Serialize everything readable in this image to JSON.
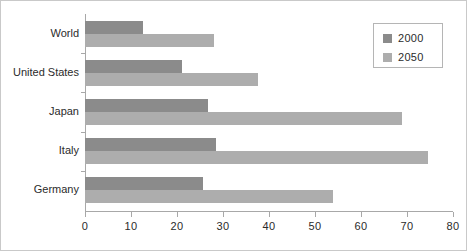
{
  "chart_data": {
    "type": "bar",
    "orientation": "horizontal",
    "title": "",
    "xlabel": "",
    "ylabel": "",
    "categories": [
      "World",
      "United States",
      "Japan",
      "Italy",
      "Germany"
    ],
    "series": [
      {
        "name": "2000",
        "color": "#8b8b8b",
        "values": [
          12.6,
          21.0,
          26.7,
          28.5,
          25.7
        ]
      },
      {
        "name": "2050",
        "color": "#adadad",
        "values": [
          28.0,
          37.5,
          69.0,
          74.5,
          54.0
        ]
      }
    ],
    "xlim": [
      0,
      80
    ],
    "xticks": [
      0,
      10,
      20,
      30,
      40,
      50,
      60,
      70,
      80
    ],
    "xtick_labels": [
      "0",
      "10",
      "20",
      "30",
      "40",
      "50",
      "60",
      "70",
      "80"
    ],
    "grid": false,
    "legend_position": "top-right"
  },
  "legend": {
    "entries": [
      {
        "label": "2000",
        "color": "#8b8b8b"
      },
      {
        "label": "2050",
        "color": "#adadad"
      }
    ]
  },
  "colors": {
    "series_2000": "#8b8b8b",
    "series_2050": "#adadad",
    "axis": "#a8a8a8",
    "text": "#2b2b2b",
    "frame": "#c9c9c9",
    "background": "#ffffff"
  }
}
